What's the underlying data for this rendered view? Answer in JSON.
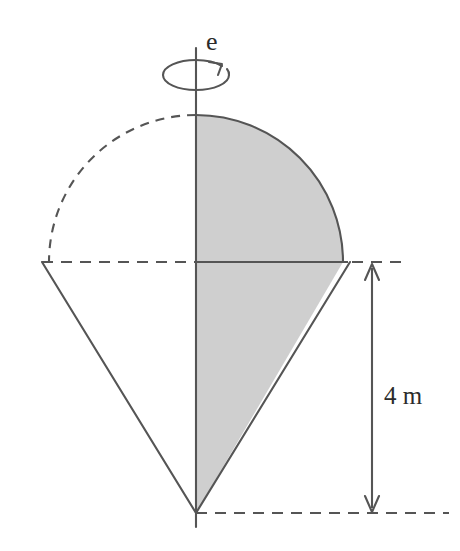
{
  "figure": {
    "background_color": "#ffffff",
    "stroke_color": "#555555",
    "shade_fill_color": "#cfcfcf",
    "shade_stroke_color": "#555555",
    "text_color": "#2b2b2b",
    "labels": {
      "axis_label": "e",
      "dimension_label": "4 m"
    },
    "icons": {
      "rotation_arrow": "rotation-arrow-icon",
      "dimension_arrow": "double-headed-arrow-icon"
    },
    "geometry": {
      "axis_x": 196,
      "axis_top_y": 48,
      "axis_bottom_y": 527,
      "circle_center_x": 196,
      "circle_center_y": 262,
      "circle_radius": 147,
      "cone_apex_x": 196,
      "cone_apex_y": 513,
      "cone_left_x": 42,
      "cone_right_x": 352,
      "midline_y": 262,
      "base_line_y": 513,
      "dimension_arrow_x": 372,
      "dimension_top_y": 265,
      "dimension_bottom_y": 511
    },
    "line_styles": {
      "left_arc": "dashed",
      "right_arc": "solid",
      "left_cone_edge": "solid",
      "right_cone_edge": "solid",
      "midline_left": "dashed",
      "midline_right_of_circle": "dashed",
      "base_line": "dashed"
    },
    "dimension": {
      "value": "4",
      "unit": "m",
      "measures": "height from mid-plane to cone apex"
    }
  }
}
